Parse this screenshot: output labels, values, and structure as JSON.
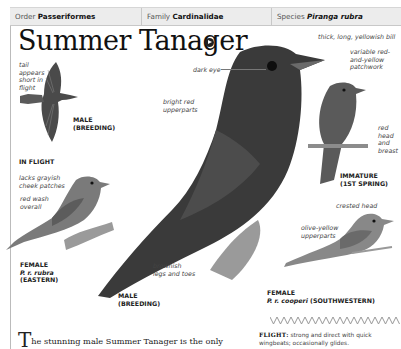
{
  "taxonomy": {
    "order_label": "Order",
    "order_value": "Passeriformes",
    "family_label": "Family",
    "family_value": "Cardinalidae",
    "species_label": "Species",
    "species_value": "Piranga rubra"
  },
  "title": "Summer Tanager",
  "sound_icon": "speaker-icon",
  "labels": {
    "tail": [
      "tail",
      "appears",
      "short in",
      "flight"
    ],
    "dark_eye": "dark eye",
    "bright_red": [
      "bright red",
      "upperparts"
    ],
    "bill": "thick, long, yellowish bill",
    "patchwork": [
      "variable red-",
      "and-yellow",
      "patchwork"
    ],
    "red_head": [
      "red",
      "head",
      "and",
      "breast"
    ],
    "cheek": [
      "lacks grayish",
      "cheek patches"
    ],
    "red_wash": [
      "red wash",
      "overall"
    ],
    "crested": "crested head",
    "olive": [
      "olive-yellow",
      "upperparts"
    ],
    "legs": [
      "brownish",
      "legs and toes"
    ]
  },
  "captions": {
    "flight_male": [
      "MALE",
      "(BREEDING)"
    ],
    "in_flight": "IN FLIGHT",
    "immature": [
      "IMMATURE",
      "(1ST SPRING)"
    ],
    "female_eastern": [
      "FEMALE",
      "P. r. rubra",
      "(EASTERN)"
    ],
    "male_main": [
      "MALE",
      "(BREEDING)"
    ],
    "female_sw": [
      "FEMALE",
      "P. r. cooperi",
      "(SOUTHWESTERN)"
    ]
  },
  "flight": {
    "heading": "FLIGHT:",
    "text_line1": "strong and direct with quick",
    "text_line2": "wingbeats; occasionally glides."
  },
  "body": {
    "dropcap": "T",
    "text": "he stunning male Summer Tanager is the only"
  },
  "colors": {
    "bird_dark": "#3a3a3a",
    "bird_mid": "#6a6a6a",
    "bird_light": "#8c8c8c",
    "header_bg": "#ececec"
  }
}
